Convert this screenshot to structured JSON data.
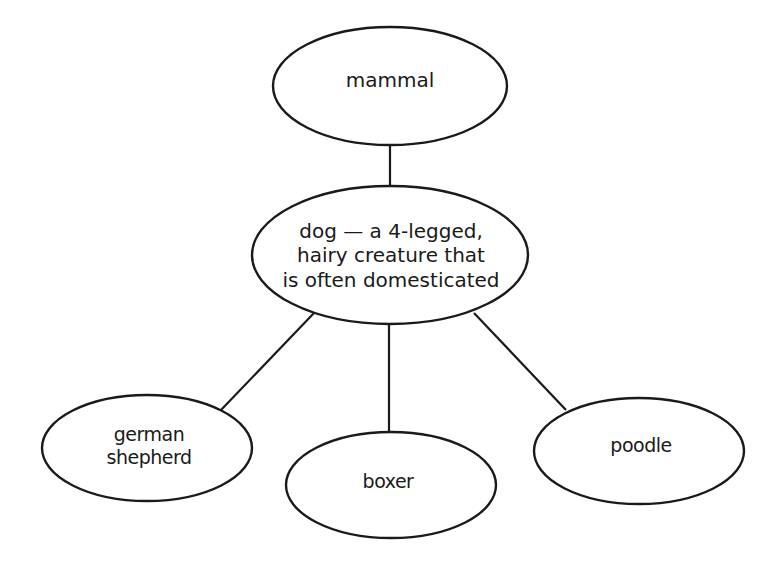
{
  "diagram": {
    "type": "concept-map",
    "nodes": {
      "mammal": {
        "label": "mammal"
      },
      "dog": {
        "lines": [
          "dog — a 4-legged,",
          "hairy creature that",
          "is often domesticated"
        ]
      },
      "german_shepherd": {
        "lines": [
          "german",
          "shepherd"
        ]
      },
      "boxer": {
        "label": "boxer"
      },
      "poodle": {
        "label": "poodle"
      }
    },
    "edges": [
      {
        "from": "mammal",
        "to": "dog"
      },
      {
        "from": "dog",
        "to": "german shepherd"
      },
      {
        "from": "dog",
        "to": "boxer"
      },
      {
        "from": "dog",
        "to": "poodle"
      }
    ],
    "colors": {
      "stroke": "#1a1a1a",
      "fill": "#ffffff",
      "text": "#1a1a1a"
    }
  }
}
